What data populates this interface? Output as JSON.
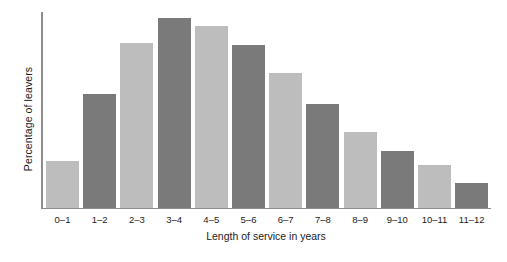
{
  "chart_data": {
    "type": "bar",
    "title": "",
    "xlabel": "Length of service in years",
    "ylabel": "Percentage of leavers",
    "categories": [
      "0–1",
      "1–2",
      "2–3",
      "3–4",
      "4–5",
      "5–6",
      "6–7",
      "7–8",
      "8–9",
      "9–10",
      "10–11",
      "11–12"
    ],
    "values": [
      24,
      58,
      84,
      97,
      93,
      83,
      69,
      53,
      39,
      29,
      22,
      13
    ],
    "ylim": [
      0,
      100
    ],
    "y_ticks_visible": false,
    "grid": false,
    "legend": null,
    "bar_colors": [
      "#bdbdbd",
      "#7a7a7a",
      "#bdbdbd",
      "#7a7a7a",
      "#bdbdbd",
      "#7a7a7a",
      "#bdbdbd",
      "#7a7a7a",
      "#bdbdbd",
      "#7a7a7a",
      "#bdbdbd",
      "#7a7a7a"
    ],
    "color_light": "#bdbdbd",
    "color_dark": "#7a7a7a",
    "axis_color": "#8d8d8d",
    "text_color": "#1b1b1b",
    "background": "#ffffff"
  },
  "axes": {
    "y_title": "Percentage of leavers",
    "x_title": "Length of service in years"
  }
}
